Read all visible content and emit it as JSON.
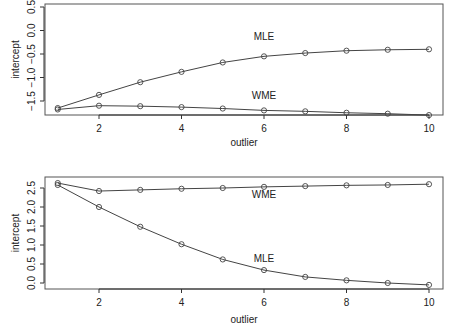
{
  "chart_data": [
    {
      "type": "line",
      "title": "",
      "xlabel": "outlier",
      "ylabel": "intercept",
      "x": [
        1,
        2,
        3,
        4,
        5,
        6,
        7,
        8,
        9,
        10
      ],
      "xticks": [
        "2",
        "4",
        "6",
        "8",
        "10"
      ],
      "yticks": [
        "-1.5",
        "-1.0",
        "-0.5",
        "0.0",
        "0.5"
      ],
      "ylim": [
        -1.8,
        0.55
      ],
      "xlim": [
        0.5,
        10.4
      ],
      "grid": false,
      "legend": "none (inline annotations)",
      "series": [
        {
          "name": "MLE",
          "values": [
            -1.65,
            -1.37,
            -1.1,
            -0.88,
            -0.68,
            -0.55,
            -0.48,
            -0.43,
            -0.41,
            -0.4
          ]
        },
        {
          "name": "WME",
          "values": [
            -1.68,
            -1.6,
            -1.61,
            -1.63,
            -1.66,
            -1.7,
            -1.72,
            -1.75,
            -1.77,
            -1.8
          ]
        }
      ],
      "annotations": [
        {
          "text": "MLE",
          "x": 6.0,
          "y": -0.2
        },
        {
          "text": "WME",
          "x": 6.0,
          "y": -1.45
        }
      ]
    },
    {
      "type": "line",
      "title": "",
      "xlabel": "outlier",
      "ylabel": "intercept",
      "x": [
        1,
        2,
        3,
        4,
        5,
        6,
        7,
        8,
        9,
        10
      ],
      "xticks": [
        "2",
        "4",
        "6",
        "8",
        "10"
      ],
      "yticks": [
        "0.0",
        "0.5",
        "1.0",
        "1.5",
        "2.0",
        "2.5"
      ],
      "ylim": [
        -0.1,
        2.78
      ],
      "xlim": [
        0.5,
        10.4
      ],
      "grid": false,
      "legend": "none (inline annotations)",
      "series": [
        {
          "name": "WME",
          "values": [
            2.63,
            2.42,
            2.45,
            2.48,
            2.5,
            2.53,
            2.55,
            2.57,
            2.58,
            2.6
          ]
        },
        {
          "name": "MLE",
          "values": [
            2.58,
            2.0,
            1.48,
            1.02,
            0.62,
            0.34,
            0.16,
            0.07,
            0.0,
            -0.05
          ]
        }
      ],
      "annotations": [
        {
          "text": "WME",
          "x": 6.0,
          "y": 2.25
        },
        {
          "text": "MLE",
          "x": 6.0,
          "y": 0.55
        }
      ]
    }
  ]
}
